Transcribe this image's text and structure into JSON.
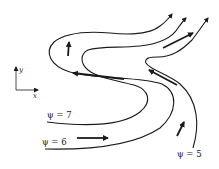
{
  "figure": {
    "axes": {
      "x_label": "x",
      "y_label": "y"
    },
    "streamlines": [
      {
        "id": "psi7",
        "label": "ψ = 7"
      },
      {
        "id": "psi6",
        "label": "ψ = 6"
      },
      {
        "id": "psi5",
        "label": "ψ = 5"
      }
    ],
    "flow_arrows": [
      "right",
      "up-right",
      "up-left",
      "left",
      "up",
      "right-up"
    ]
  }
}
